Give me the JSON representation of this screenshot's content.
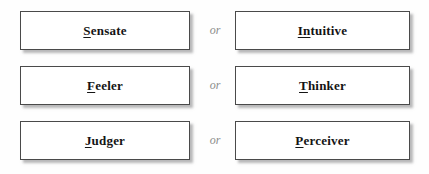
{
  "page": {
    "background_color": "#fefefe",
    "box_border_color": "#4a4a4a",
    "box_fill_color": "#ffffff",
    "text_color": "#141414",
    "or_text_color": "#8d8d8d"
  },
  "separator": {
    "label": "or"
  },
  "rows": [
    {
      "left": {
        "key": "S",
        "rest": "ensate",
        "full": "Sensate"
      },
      "separator": "or",
      "right": {
        "key": "In",
        "rest": "tuitive",
        "full": "Intuitive"
      }
    },
    {
      "left": {
        "key": "F",
        "rest": "eeler",
        "full": "Feeler"
      },
      "separator": "or",
      "right": {
        "key": "T",
        "rest": "hinker",
        "full": "Thinker"
      }
    },
    {
      "left": {
        "key": "J",
        "rest": "udger",
        "full": "Judger"
      },
      "separator": "or",
      "right": {
        "key": "P",
        "rest": "erceiver",
        "full": "Perceiver"
      }
    }
  ]
}
